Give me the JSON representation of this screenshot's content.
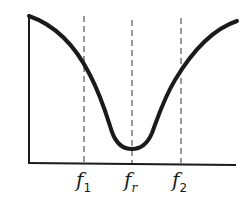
{
  "diagram": {
    "type": "band-stop frequency response",
    "colors": {
      "curve": "#1a1a1a",
      "axes": "#1a1a1a",
      "dashed": "#333333",
      "background": "#ffffff"
    },
    "labels": [
      {
        "id": "f1",
        "base": "f",
        "sub": "1"
      },
      {
        "id": "fr",
        "base": "f",
        "sub": "r"
      },
      {
        "id": "f2",
        "base": "f",
        "sub": "2"
      }
    ]
  }
}
